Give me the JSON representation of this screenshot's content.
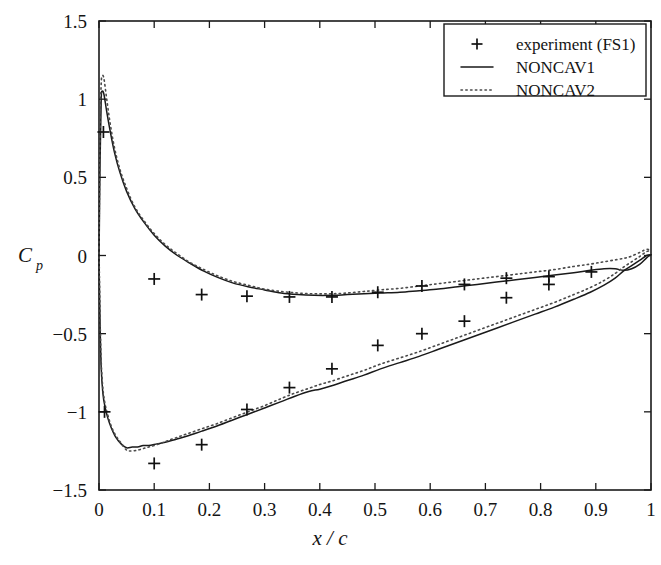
{
  "chart_data": {
    "type": "line",
    "title": "",
    "xlabel": "x / c",
    "ylabel": "Cp",
    "ylabel_base": "C",
    "ylabel_sub": "p",
    "xlim": [
      0,
      1
    ],
    "ylim": [
      -1.5,
      1.5
    ],
    "grid": false,
    "x_ticks": [
      0,
      0.1,
      0.2,
      0.3,
      0.4,
      0.5,
      0.6,
      0.7,
      0.8,
      0.9,
      1
    ],
    "x_tick_labels": [
      "0",
      "0.1",
      "0.2",
      "0.3",
      "0.4",
      "0.5",
      "0.6",
      "0.7",
      "0.8",
      "0.9",
      "1"
    ],
    "y_ticks": [
      1.5,
      1,
      0.5,
      0,
      -0.5,
      -1,
      -1.5
    ],
    "y_tick_labels": [
      "1.5",
      "1",
      "0.5",
      "0",
      "-0.5",
      "-1",
      "-1.5"
    ],
    "legend_position": "top-right",
    "series": [
      {
        "name": "experiment (FS1)",
        "style": "marker",
        "marker": "plus",
        "color": "#111111",
        "points": [
          [
            0.008,
            0.79
          ],
          [
            0.1,
            -0.15
          ],
          [
            0.186,
            -0.25
          ],
          [
            0.268,
            -0.26
          ],
          [
            0.345,
            -0.265
          ],
          [
            0.422,
            -0.265
          ],
          [
            0.505,
            -0.235
          ],
          [
            0.585,
            -0.195
          ],
          [
            0.662,
            -0.185
          ],
          [
            0.738,
            -0.145
          ],
          [
            0.815,
            -0.135
          ],
          [
            0.892,
            -0.105
          ],
          [
            0.01,
            -1.0
          ],
          [
            0.1,
            -1.33
          ],
          [
            0.186,
            -1.21
          ],
          [
            0.268,
            -0.985
          ],
          [
            0.345,
            -0.845
          ],
          [
            0.422,
            -0.725
          ],
          [
            0.505,
            -0.575
          ],
          [
            0.585,
            -0.5
          ],
          [
            0.662,
            -0.42
          ],
          [
            0.738,
            -0.27
          ],
          [
            0.815,
            -0.185
          ]
        ]
      },
      {
        "name": "NONCAV1",
        "style": "solid",
        "color": "#1a1a1a",
        "upper": [
          [
            0.0,
            -0.02
          ],
          [
            0.002,
            0.62
          ],
          [
            0.004,
            1.0
          ],
          [
            0.006,
            1.05
          ],
          [
            0.009,
            1.03
          ],
          [
            0.014,
            0.92
          ],
          [
            0.02,
            0.8
          ],
          [
            0.028,
            0.66
          ],
          [
            0.038,
            0.53
          ],
          [
            0.05,
            0.41
          ],
          [
            0.065,
            0.3
          ],
          [
            0.082,
            0.21
          ],
          [
            0.1,
            0.13
          ],
          [
            0.12,
            0.06
          ],
          [
            0.142,
            0.0
          ],
          [
            0.165,
            -0.05
          ],
          [
            0.19,
            -0.1
          ],
          [
            0.215,
            -0.14
          ],
          [
            0.242,
            -0.175
          ],
          [
            0.27,
            -0.2
          ],
          [
            0.3,
            -0.22
          ],
          [
            0.33,
            -0.24
          ],
          [
            0.36,
            -0.25
          ],
          [
            0.39,
            -0.255
          ],
          [
            0.42,
            -0.255
          ],
          [
            0.45,
            -0.25
          ],
          [
            0.48,
            -0.245
          ],
          [
            0.51,
            -0.24
          ],
          [
            0.545,
            -0.235
          ],
          [
            0.58,
            -0.225
          ],
          [
            0.615,
            -0.215
          ],
          [
            0.65,
            -0.2
          ],
          [
            0.685,
            -0.185
          ],
          [
            0.72,
            -0.17
          ],
          [
            0.755,
            -0.155
          ],
          [
            0.79,
            -0.14
          ],
          [
            0.825,
            -0.125
          ],
          [
            0.86,
            -0.11
          ],
          [
            0.89,
            -0.095
          ],
          [
            0.915,
            -0.085
          ],
          [
            0.935,
            -0.085
          ],
          [
            0.95,
            -0.095
          ],
          [
            0.965,
            -0.085
          ],
          [
            0.98,
            -0.055
          ],
          [
            0.992,
            -0.015
          ],
          [
            1.0,
            0.005
          ]
        ],
        "lower": [
          [
            0.0,
            -0.02
          ],
          [
            0.002,
            -0.45
          ],
          [
            0.004,
            -0.72
          ],
          [
            0.007,
            -0.88
          ],
          [
            0.011,
            -0.97
          ],
          [
            0.016,
            -1.04
          ],
          [
            0.022,
            -1.1
          ],
          [
            0.03,
            -1.16
          ],
          [
            0.04,
            -1.205
          ],
          [
            0.05,
            -1.23
          ],
          [
            0.06,
            -1.225
          ],
          [
            0.07,
            -1.225
          ],
          [
            0.08,
            -1.215
          ],
          [
            0.09,
            -1.215
          ],
          [
            0.105,
            -1.205
          ],
          [
            0.12,
            -1.195
          ],
          [
            0.14,
            -1.175
          ],
          [
            0.16,
            -1.155
          ],
          [
            0.185,
            -1.125
          ],
          [
            0.21,
            -1.095
          ],
          [
            0.24,
            -1.055
          ],
          [
            0.27,
            -1.015
          ],
          [
            0.3,
            -0.975
          ],
          [
            0.33,
            -0.935
          ],
          [
            0.355,
            -0.9
          ],
          [
            0.38,
            -0.87
          ],
          [
            0.4,
            -0.855
          ],
          [
            0.42,
            -0.835
          ],
          [
            0.45,
            -0.8
          ],
          [
            0.48,
            -0.765
          ],
          [
            0.51,
            -0.725
          ],
          [
            0.545,
            -0.685
          ],
          [
            0.58,
            -0.645
          ],
          [
            0.615,
            -0.6
          ],
          [
            0.65,
            -0.555
          ],
          [
            0.685,
            -0.51
          ],
          [
            0.72,
            -0.465
          ],
          [
            0.755,
            -0.42
          ],
          [
            0.79,
            -0.375
          ],
          [
            0.825,
            -0.33
          ],
          [
            0.86,
            -0.28
          ],
          [
            0.89,
            -0.235
          ],
          [
            0.915,
            -0.19
          ],
          [
            0.935,
            -0.145
          ],
          [
            0.95,
            -0.1
          ],
          [
            0.965,
            -0.065
          ],
          [
            0.98,
            -0.03
          ],
          [
            0.992,
            0.0
          ],
          [
            1.0,
            0.005
          ]
        ]
      },
      {
        "name": "NONCAV2",
        "style": "dotted",
        "color": "#4a4a4a",
        "upper": [
          [
            0.0,
            0.05
          ],
          [
            0.002,
            0.8
          ],
          [
            0.004,
            1.1
          ],
          [
            0.006,
            1.15
          ],
          [
            0.009,
            1.13
          ],
          [
            0.014,
            1.0
          ],
          [
            0.02,
            0.85
          ],
          [
            0.028,
            0.69
          ],
          [
            0.038,
            0.55
          ],
          [
            0.05,
            0.43
          ],
          [
            0.065,
            0.31
          ],
          [
            0.082,
            0.22
          ],
          [
            0.1,
            0.14
          ],
          [
            0.12,
            0.07
          ],
          [
            0.142,
            0.01
          ],
          [
            0.165,
            -0.045
          ],
          [
            0.19,
            -0.09
          ],
          [
            0.215,
            -0.13
          ],
          [
            0.242,
            -0.165
          ],
          [
            0.27,
            -0.19
          ],
          [
            0.3,
            -0.215
          ],
          [
            0.33,
            -0.23
          ],
          [
            0.36,
            -0.24
          ],
          [
            0.39,
            -0.245
          ],
          [
            0.42,
            -0.245
          ],
          [
            0.45,
            -0.24
          ],
          [
            0.48,
            -0.23
          ],
          [
            0.51,
            -0.22
          ],
          [
            0.545,
            -0.21
          ],
          [
            0.58,
            -0.195
          ],
          [
            0.615,
            -0.18
          ],
          [
            0.65,
            -0.165
          ],
          [
            0.685,
            -0.15
          ],
          [
            0.72,
            -0.135
          ],
          [
            0.755,
            -0.12
          ],
          [
            0.79,
            -0.105
          ],
          [
            0.825,
            -0.09
          ],
          [
            0.86,
            -0.07
          ],
          [
            0.89,
            -0.055
          ],
          [
            0.915,
            -0.04
          ],
          [
            0.94,
            -0.025
          ],
          [
            0.96,
            -0.01
          ],
          [
            0.98,
            0.02
          ],
          [
            0.992,
            0.04
          ],
          [
            1.0,
            0.03
          ]
        ],
        "lower": [
          [
            0.0,
            0.05
          ],
          [
            0.002,
            -0.4
          ],
          [
            0.004,
            -0.68
          ],
          [
            0.007,
            -0.85
          ],
          [
            0.011,
            -0.95
          ],
          [
            0.016,
            -1.02
          ],
          [
            0.022,
            -1.09
          ],
          [
            0.03,
            -1.15
          ],
          [
            0.04,
            -1.2
          ],
          [
            0.05,
            -1.245
          ],
          [
            0.06,
            -1.25
          ],
          [
            0.07,
            -1.245
          ],
          [
            0.08,
            -1.235
          ],
          [
            0.09,
            -1.225
          ],
          [
            0.105,
            -1.21
          ],
          [
            0.12,
            -1.19
          ],
          [
            0.14,
            -1.165
          ],
          [
            0.16,
            -1.14
          ],
          [
            0.185,
            -1.11
          ],
          [
            0.21,
            -1.08
          ],
          [
            0.24,
            -1.04
          ],
          [
            0.27,
            -1.0
          ],
          [
            0.3,
            -0.96
          ],
          [
            0.33,
            -0.915
          ],
          [
            0.355,
            -0.88
          ],
          [
            0.38,
            -0.85
          ],
          [
            0.4,
            -0.825
          ],
          [
            0.42,
            -0.805
          ],
          [
            0.45,
            -0.77
          ],
          [
            0.48,
            -0.735
          ],
          [
            0.51,
            -0.695
          ],
          [
            0.545,
            -0.655
          ],
          [
            0.58,
            -0.615
          ],
          [
            0.615,
            -0.57
          ],
          [
            0.65,
            -0.525
          ],
          [
            0.685,
            -0.48
          ],
          [
            0.72,
            -0.435
          ],
          [
            0.755,
            -0.39
          ],
          [
            0.79,
            -0.345
          ],
          [
            0.825,
            -0.3
          ],
          [
            0.86,
            -0.25
          ],
          [
            0.89,
            -0.205
          ],
          [
            0.915,
            -0.16
          ],
          [
            0.935,
            -0.115
          ],
          [
            0.95,
            -0.075
          ],
          [
            0.965,
            -0.04
          ],
          [
            0.98,
            -0.005
          ],
          [
            0.992,
            0.025
          ],
          [
            1.0,
            0.03
          ]
        ]
      }
    ]
  },
  "legend": {
    "items": [
      {
        "label": "experiment (FS1)",
        "style": "marker"
      },
      {
        "label": "NONCAV1",
        "style": "solid"
      },
      {
        "label": "NONCAV2",
        "style": "dotted"
      }
    ]
  },
  "colors": {
    "axis": "#1a1a1a",
    "solid_series": "#1a1a1a",
    "dotted_series": "#4a4a4a",
    "marker": "#111111",
    "background": "#ffffff"
  }
}
